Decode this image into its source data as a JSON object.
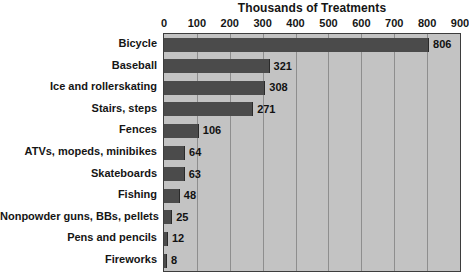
{
  "chart_data": {
    "type": "bar",
    "orientation": "horizontal",
    "title": "Thousands of Treatments",
    "xlabel": "",
    "ylabel": "",
    "xlim": [
      0,
      900
    ],
    "ticks": [
      0,
      100,
      200,
      300,
      400,
      500,
      600,
      700,
      800,
      900
    ],
    "tick_labels": [
      "0",
      "100",
      "200",
      "300",
      "400",
      "500",
      "600",
      "700",
      "800",
      "900"
    ],
    "grid": true,
    "legend": false,
    "categories": [
      "Bicycle",
      "Baseball",
      "Ice and rollerskating",
      "Stairs, steps",
      "Fences",
      "ATVs, mopeds, minibikes",
      "Skateboards",
      "Fishing",
      "Nonpowder guns, BBs, pellets",
      "Pens and pencils",
      "Fireworks"
    ],
    "values": [
      806,
      321,
      308,
      271,
      106,
      64,
      63,
      48,
      25,
      12,
      8
    ],
    "value_labels": [
      "806",
      "321",
      "308",
      "271",
      "106",
      "64",
      "63",
      "48",
      "25",
      "12",
      "8"
    ],
    "colors": {
      "bar": "#4b4b4b",
      "plot_background": "#c3c3c3",
      "gridline": "#8e8e8e",
      "border": "#3d3d3d",
      "text": "#151515",
      "page_background": "#ffffff"
    }
  }
}
